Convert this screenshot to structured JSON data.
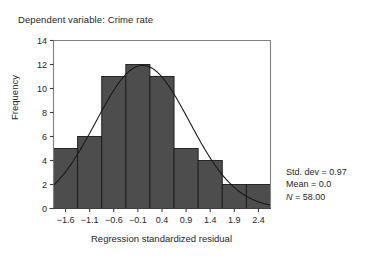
{
  "caption": "Dependent variable: Crime rate",
  "chart_data": {
    "type": "bar",
    "title": "",
    "xlabel": "Regression standardized residual",
    "ylabel": "Frequency",
    "categories": [
      "-1.6",
      "-1.1",
      "-0.6",
      "-0.1",
      "0.4",
      "0.9",
      "1.4",
      "1.9",
      "2.4"
    ],
    "values": [
      5,
      6,
      11,
      12,
      11,
      5,
      4,
      2,
      2
    ],
    "xtick_labels": [
      "−1.6",
      "−1.1",
      "−0.6",
      "−0.1",
      "0.4",
      "0.9",
      "1.4",
      "1.9",
      "2.4"
    ],
    "ytick_labels": [
      "0",
      "2",
      "4",
      "6",
      "8",
      "10",
      "12",
      "14"
    ],
    "ytick_values": [
      0,
      2,
      4,
      6,
      8,
      10,
      12,
      14
    ],
    "ylim": [
      0,
      14
    ],
    "xlim": [
      -1.85,
      2.65
    ],
    "bar_width": 0.5,
    "grid": false,
    "legend": false,
    "bar_color": "#4d4d4d",
    "bar_edge_color": "#1a1a1a",
    "curve_color": "#1a1a1a",
    "overlay_curve": "normal",
    "axis_color": "#808080",
    "normal_curve": {
      "mean": 0.0,
      "std_dev": 0.97,
      "n": 58,
      "bin_width": 0.5,
      "peak_frequency": 11.9
    }
  },
  "statistics": {
    "std_dev_label": "Std. dev = 0.97",
    "mean_label": "Mean = 0.0",
    "n_symbol": "N",
    "n_value": " = 58.00"
  }
}
